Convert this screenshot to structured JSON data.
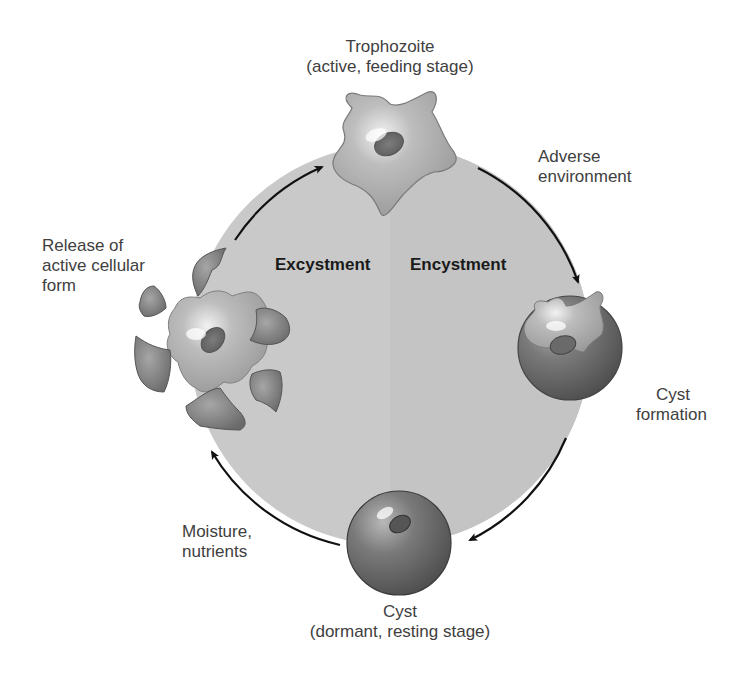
{
  "diagram": {
    "phases": {
      "excystment": "Excystment",
      "encystment": "Encystment"
    },
    "stages": {
      "trophozoite": {
        "name": "Trophozoite",
        "desc": "(active, feeding stage)"
      },
      "cyst_formation": {
        "line1": "Cyst",
        "line2": "formation"
      },
      "cyst": {
        "name": "Cyst",
        "desc": "(dormant, resting stage)"
      },
      "release": {
        "line1": "Release of",
        "line2": "active cellular",
        "line3": "form"
      }
    },
    "transitions": {
      "adverse": {
        "line1": "Adverse",
        "line2": "environment"
      },
      "moisture": {
        "line1": "Moisture,",
        "line2": "nutrients"
      }
    },
    "colors": {
      "circle_fill": "#c8c8c8",
      "cell_body": "#b4b4b4",
      "cyst_wall": "#6e6e6e",
      "arrow": "#111111"
    }
  }
}
